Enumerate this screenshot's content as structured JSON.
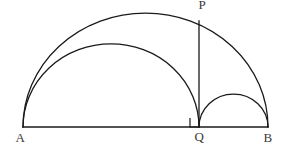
{
  "figure": {
    "background_color": "#ffffff",
    "stroke_color": "#1a1a1a",
    "label_color": "#3a3a3a",
    "stroke_width": 1.3
  },
  "labels": {
    "A": "A",
    "B": "B",
    "Q": "Q",
    "P": "P"
  },
  "chart_data": {
    "type": "diagram",
    "coordinate_system": "screen pixels, origin top-left, 290x158",
    "points": [
      {
        "name": "A",
        "x": 23,
        "y": 127,
        "label": "A",
        "label_x": 20,
        "label_y": 142
      },
      {
        "name": "Q",
        "x": 199,
        "y": 127,
        "label": "Q",
        "label_x": 199,
        "label_y": 141
      },
      {
        "name": "B",
        "x": 268,
        "y": 127,
        "label": "B",
        "label_x": 268,
        "label_y": 142
      },
      {
        "name": "P",
        "x": 199,
        "y": 21,
        "label": "P",
        "label_x": 202,
        "label_y": 9
      }
    ],
    "segments": [
      {
        "name": "baseline-AB",
        "from": "A",
        "to": "B",
        "x1": 23,
        "y1": 127,
        "x2": 268,
        "y2": 127
      },
      {
        "name": "altitude-PQ",
        "from": "P",
        "to": "Q",
        "x1": 199,
        "y1": 21,
        "x2": 199,
        "y2": 127
      }
    ],
    "arcs": [
      {
        "name": "large-semicircle-AB",
        "from": "A",
        "to": "B",
        "center_x": 145.5,
        "center_y": 127,
        "radius": 122.5,
        "apex_x": 145.5,
        "apex_y": 13,
        "sweep": "upper half",
        "squash_y": 0.93
      },
      {
        "name": "medium-semicircle-AQ",
        "from": "A",
        "to": "Q",
        "center_x": 111,
        "center_y": 127,
        "radius": 88,
        "apex_x": 111,
        "apex_y": 44,
        "sweep": "upper half",
        "squash_y": 0.945
      },
      {
        "name": "small-semicircle-QB",
        "from": "Q",
        "to": "B",
        "center_x": 233.5,
        "center_y": 127,
        "radius": 34.5,
        "apex_x": 233.5,
        "apex_y": 94,
        "sweep": "upper half",
        "squash_y": 0.955
      }
    ],
    "markers": [
      {
        "name": "right-angle-at-Q",
        "type": "right-angle-square",
        "x": 190,
        "y": 118,
        "size": 9,
        "corner": "bottom-right",
        "description": "square marking PQ perpendicular to AB at Q"
      }
    ],
    "annotations": [
      "PQ is perpendicular to AB at Q",
      "P lies on the large semicircle with diameter AB",
      "Semicircles are drawn on diameters AQ and QB"
    ]
  }
}
